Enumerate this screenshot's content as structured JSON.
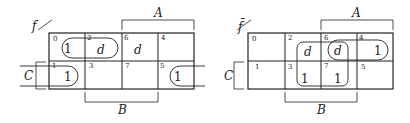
{
  "maps": [
    {
      "function_label": "f",
      "variables": {
        "top": "A",
        "bottom": "B",
        "left": "C"
      },
      "cells": [
        {
          "index": "0",
          "value": "1"
        },
        {
          "index": "2",
          "value": "d"
        },
        {
          "index": "6",
          "value": "d"
        },
        {
          "index": "4",
          "value": ""
        },
        {
          "index": "1",
          "value": "1"
        },
        {
          "index": "3",
          "value": ""
        },
        {
          "index": "7",
          "value": ""
        },
        {
          "index": "5",
          "value": "1"
        }
      ],
      "groupings": [
        "cells 0,2",
        "cells 1,5 (wrap-around)"
      ]
    },
    {
      "function_label": "f̄",
      "variables": {
        "top": "A",
        "bottom": "B",
        "left": "C"
      },
      "cells": [
        {
          "index": "0",
          "value": ""
        },
        {
          "index": "2",
          "value": "d"
        },
        {
          "index": "6",
          "value": "d"
        },
        {
          "index": "4",
          "value": "1"
        },
        {
          "index": "1",
          "value": ""
        },
        {
          "index": "3",
          "value": "1"
        },
        {
          "index": "7",
          "value": "1"
        },
        {
          "index": "5",
          "value": ""
        }
      ],
      "groupings": [
        "cells 2,6,3,7",
        "cells 6,4"
      ]
    }
  ]
}
